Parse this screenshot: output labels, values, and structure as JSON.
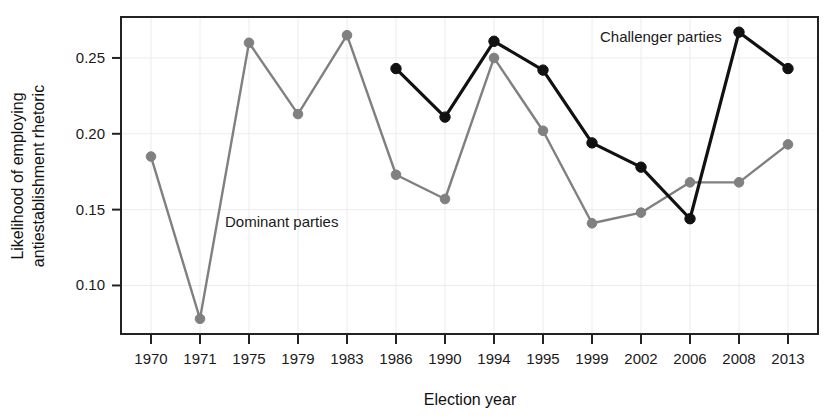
{
  "chart_data": {
    "type": "line",
    "title": "",
    "xlabel": "Election year",
    "ylabel": "Likelihood of employing antiestablishment rhetoric",
    "ylabel_line1": "Likelihood of employing",
    "ylabel_line2": "antiestablishment rhetoric",
    "categories": [
      "1970",
      "1971",
      "1975",
      "1979",
      "1983",
      "1986",
      "1990",
      "1994",
      "1995",
      "1999",
      "2002",
      "2006",
      "2008",
      "2013"
    ],
    "xtick_labels": [
      "1970",
      "1971",
      "1975",
      "1979",
      "1983",
      "1986",
      "1990",
      "1994",
      "1995",
      "1999",
      "2002",
      "2006",
      "2008",
      "2013"
    ],
    "ytick_labels": [
      "0.10",
      "0.15",
      "0.20",
      "0.25"
    ],
    "ytick_values": [
      0.1,
      0.15,
      0.2,
      0.25
    ],
    "ylim": [
      0.068,
      0.277
    ],
    "grid": true,
    "legend_position": "inline-annotations",
    "series": [
      {
        "name": "Dominant parties",
        "color": "#808080",
        "annotation_label": "Dominant parties",
        "values": [
          0.185,
          0.078,
          0.26,
          0.213,
          0.265,
          0.173,
          0.157,
          0.25,
          0.202,
          0.141,
          0.148,
          0.168,
          0.168,
          0.193
        ]
      },
      {
        "name": "Challenger parties",
        "color": "#111111",
        "annotation_label": "Challenger parties",
        "values": [
          null,
          null,
          null,
          null,
          null,
          0.243,
          0.211,
          0.261,
          0.242,
          0.194,
          0.178,
          0.144,
          0.267,
          0.243
        ]
      }
    ]
  },
  "annotations": {
    "dominant_label": "Dominant parties",
    "challenger_label": "Challenger parties"
  },
  "axes": {
    "x_title": "Election year",
    "y_title_line1": "Likelihood of employing",
    "y_title_line2": "antiestablishment rhetoric"
  }
}
